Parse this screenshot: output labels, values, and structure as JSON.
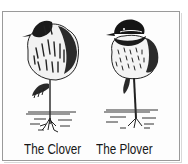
{
  "illustration": {
    "left_bird": {
      "caption": "The Clover",
      "description": "bird-like figure drawn as a clover head on a stem with roots"
    },
    "right_bird": {
      "caption": "The Plover",
      "description": "plover bird standing on one leg at water's edge"
    }
  },
  "colors": {
    "ink": "#161616",
    "frame": "#9a9a9a",
    "background": "#ffffff"
  }
}
